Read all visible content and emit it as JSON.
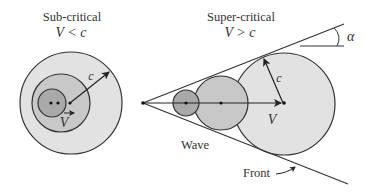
{
  "subcritical": {
    "title": "Sub-critical",
    "condition": "V < c",
    "radius_label": "c",
    "velocity_label": "V"
  },
  "supercritical": {
    "title": "Super-critical",
    "condition": "V > c",
    "radius_label": "c",
    "velocity_label": "V",
    "angle_label": "α",
    "wave_label": "Wave",
    "front_label": "Front"
  },
  "colors": {
    "stroke": "#333333",
    "fill_light": "#e2e2e2",
    "fill_mid": "#c8c8c8",
    "fill_dark": "#a9a9a9",
    "background": "#ffffff"
  }
}
